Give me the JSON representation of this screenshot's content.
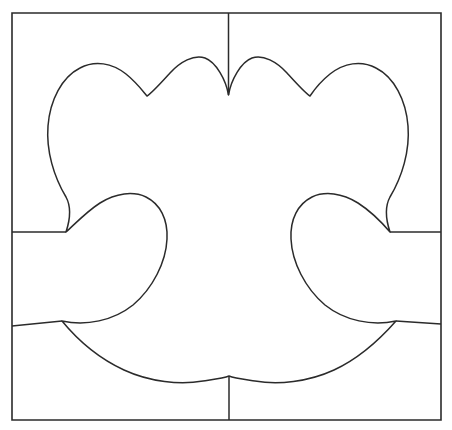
{
  "document": {
    "title": "Symmetric Lobed Motif In Square Frame",
    "kind": "line-art-pattern",
    "background_color": "#ffffff",
    "stroke_color": "#2b2b2b",
    "canvas": {
      "width": 452,
      "height": 430
    }
  },
  "frame": {
    "name": "outer-square-border",
    "x": 12,
    "y": 13,
    "width": 429,
    "height": 407,
    "stroke_width": 1.6,
    "path": "M 12 13 L 441 13 L 441 420 L 12 420 Z"
  },
  "cut_lines": [
    {
      "name": "cut-line-top-center",
      "description": "vertical line from top border down to upper center cusp",
      "path": "M 228.5 13 L 228.5 95"
    },
    {
      "name": "cut-line-bottom-center",
      "description": "vertical line from lower center cusp down to bottom border",
      "path": "M 229 376 L 229 420"
    },
    {
      "name": "cut-line-left-upper",
      "description": "horizontal line from left border to left upper arm cusp",
      "path": "M 12 232 L 66 232"
    },
    {
      "name": "cut-line-left-lower",
      "description": "slightly rising line from left border to left lower cusp",
      "path": "M 12 326 L 62 321"
    },
    {
      "name": "cut-line-right-upper",
      "description": "horizontal line from right upper arm cusp to right border",
      "path": "M 390 232 L 441 232"
    },
    {
      "name": "cut-line-right-lower",
      "description": "slightly falling line from right lower cusp to right border",
      "path": "M 396 321 L 441 324"
    }
  ],
  "motif": {
    "name": "lobed-symmetric-motif",
    "description": "Closed symmetric outline with two large upper lobes, two small upper bumps meeting at a center cusp, two inward-curling side arms, and a scalloped lower edge meeting at a bottom cusp.",
    "fill": "#ffffff",
    "stroke_width": 1.5,
    "symmetry_axis_x": 228.5,
    "key_points": {
      "top_center_cusp": [
        228.5,
        95
      ],
      "upper_left_bump_peak": [
        190,
        60
      ],
      "upper_left_notch": [
        147,
        96
      ],
      "left_lobe_peak": [
        105,
        80
      ],
      "left_lobe_far_left": [
        52,
        150
      ],
      "left_arm_outer_cusp": [
        66,
        232
      ],
      "left_arm_lobe_peak": [
        135,
        197
      ],
      "left_arm_inner_turn": [
        166,
        252
      ],
      "left_lower_cusp": [
        62,
        321
      ],
      "bottom_left_scallop": [
        185,
        382
      ],
      "bottom_center_cusp": [
        229,
        376
      ],
      "bottom_right_scallop": [
        272,
        382
      ],
      "right_lower_cusp": [
        396,
        321
      ],
      "right_arm_inner_turn": [
        291,
        252
      ],
      "right_arm_lobe_peak": [
        322,
        197
      ],
      "right_arm_outer_cusp": [
        390,
        232
      ],
      "right_lobe_far_right": [
        405,
        150
      ],
      "right_lobe_peak": [
        352,
        80
      ],
      "upper_right_notch": [
        310,
        96
      ],
      "upper_right_bump_peak": [
        268,
        60
      ]
    },
    "path": "M 228.5 95 C 226 80 216 62 205 58 C 194 54 180 62 170 73 C 160 84 152 93 147 96 C 142 90 136 82 126 74 C 112 63 95 60 80 68 C 62 77 50 100 48 126 C 46 151 54 177 66 197 C 72 208 70 220 66 232 C 74 225 86 212 100 203 C 116 193 133 191 146 197 C 160 204 168 219 167 239 C 166 262 153 288 133 305 C 113 321 86 326 62 321 C 76 338 98 358 124 370 C 150 382 180 385 203 381 C 216 379 224 378 229 376 C 234 378 242 379 255 381 C 278 385 308 382 334 370 C 360 358 381 338 396 321 C 372 326 345 321 325 305 C 305 288 292 262 291 239 C 290 219 298 204 312 197 C 325 191 342 193 358 203 C 372 212 384 225 390 232 C 386 220 384 208 390 197 C 402 177 410 151 408 126 C 406 100 394 77 376 68 C 361 60 344 63 330 74 C 320 82 314 90 310 96 C 305 93 297 84 287 73 C 277 62 263 54 252 58 C 241 62 231 80 228.5 95 Z"
  }
}
